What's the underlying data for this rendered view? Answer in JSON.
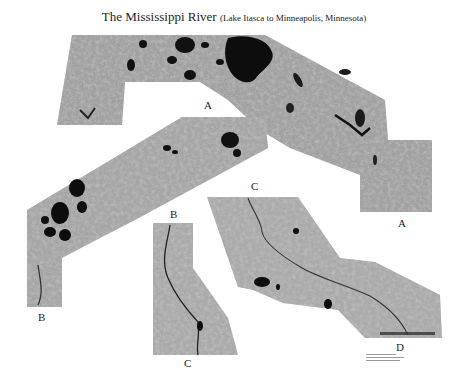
{
  "title": {
    "main": "The Mississippi River",
    "subtitle": "(Lake Itasca to Minneapolis, Minnesota)"
  },
  "segments": [
    {
      "id": "A",
      "start_label": "A",
      "end_label": "A"
    },
    {
      "id": "B",
      "start_label": "B",
      "end_label": "B"
    },
    {
      "id": "C",
      "start_label": "C",
      "end_label": "C"
    },
    {
      "id": "D",
      "start_label": "D"
    }
  ],
  "map_labels": {
    "lake": "Lake Winnibigoshish"
  },
  "colors": {
    "background": "#ffffff",
    "imagery_base": "#9a9a9a",
    "water": "#0d0d0d",
    "text": "#222222"
  }
}
